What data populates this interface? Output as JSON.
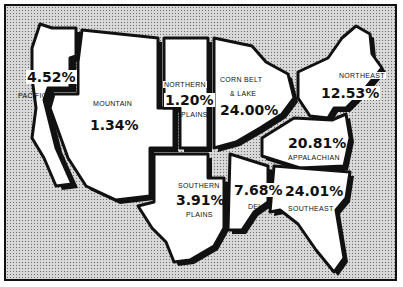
{
  "map": {
    "subject": "Regional percentages, United States",
    "regions": [
      {
        "id": "pacific",
        "name": "PACIFIC",
        "value": "4.52%"
      },
      {
        "id": "mountain",
        "name": "MOUNTAIN",
        "value": "1.34%"
      },
      {
        "id": "northern-plains",
        "name_line1": "NORTHERN",
        "name_line2": "PLAINS",
        "value": "1.20%"
      },
      {
        "id": "corn-belt-lake",
        "name_line1": "CORN BELT",
        "name_line2": "& LAKE",
        "value": "24.00%"
      },
      {
        "id": "northeast",
        "name": "NORTHEAST",
        "value": "12.53%"
      },
      {
        "id": "appalachian",
        "name": "APPALACHIAN",
        "value": "20.81%"
      },
      {
        "id": "southern-plains",
        "name_line1": "SOUTHERN",
        "name_line2": "PLAINS",
        "value": "3.91%"
      },
      {
        "id": "delta",
        "name": "DELTA",
        "value": "7.68%"
      },
      {
        "id": "southeast",
        "name": "SOUTHEAST",
        "value": "24.01%"
      }
    ]
  }
}
